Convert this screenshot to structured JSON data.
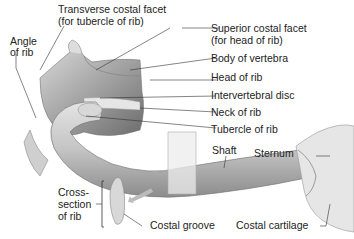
{
  "diagram": {
    "labels": {
      "transverse_costal_facet_1": "Transverse costal facet",
      "transverse_costal_facet_2": "(for tubercle of rib)",
      "angle_of_rib_1": "Angle",
      "angle_of_rib_2": "of rib",
      "superior_costal_facet_1": "Superior costal facet",
      "superior_costal_facet_2": "(for head of rib)",
      "body_of_vertebra": "Body of vertebra",
      "head_of_rib": "Head of rib",
      "intervertebral_disc": "Intervertebral disc",
      "neck_of_rib": "Neck of rib",
      "tubercle_of_rib": "Tubercle of rib",
      "shaft": "Shaft",
      "sternum": "Sternum",
      "cross_section_1": "Cross-",
      "cross_section_2": "section",
      "cross_section_3": "of rib",
      "costal_groove": "Costal groove",
      "costal_cartilage": "Costal cartilage"
    }
  }
}
